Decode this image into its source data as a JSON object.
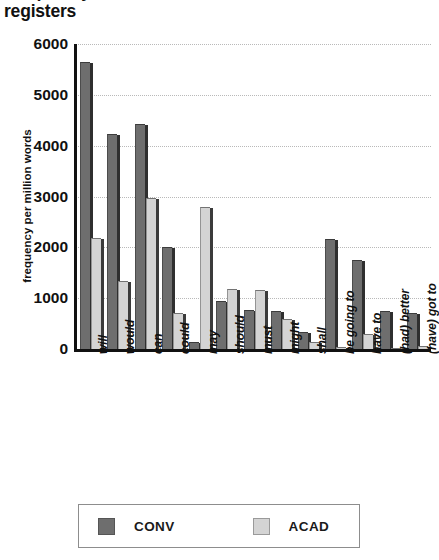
{
  "title": {
    "line1": "Frequency of modal and semi-modal verbs across",
    "line2": "registers"
  },
  "legend": {
    "position": "bottom",
    "items": [
      {
        "label": "CONV",
        "color": "#6e6e6e"
      },
      {
        "label": "ACAD",
        "color": "#d4d4d4"
      }
    ]
  },
  "axis": {
    "ylabel": "frequency per million words",
    "yticks": [
      "0",
      "1000",
      "2000",
      "3000",
      "4000",
      "5000",
      "6000"
    ]
  },
  "chart_data": {
    "type": "bar",
    "title": "Frequency of modal and semi-modal verbs across registers",
    "xlabel": "",
    "ylabel": "frequency per million words",
    "ylim": [
      0,
      6000
    ],
    "yticks": [
      0,
      1000,
      2000,
      3000,
      4000,
      5000,
      6000
    ],
    "grid": true,
    "legend_position": "bottom",
    "categories": [
      "will",
      "would",
      "can",
      "could",
      "may",
      "should",
      "must",
      "might",
      "shall",
      "be going to",
      "have to",
      "(had) better",
      "(have) got to"
    ],
    "series": [
      {
        "name": "CONV",
        "color": "#6e6e6e",
        "values": [
          5650,
          4230,
          4430,
          2000,
          130,
          950,
          760,
          740,
          330,
          2170,
          1750,
          740,
          700
        ]
      },
      {
        "name": "ACAD",
        "color": "#d4d4d4",
        "values": [
          2180,
          1340,
          2980,
          700,
          2790,
          1180,
          1170,
          600,
          130,
          40,
          290,
          20,
          55
        ]
      }
    ]
  }
}
